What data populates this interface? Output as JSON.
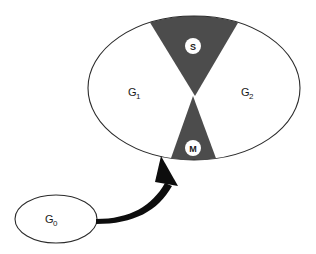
{
  "diagram": {
    "colors": {
      "background": "#ffffff",
      "outline": "#2b2b2b",
      "wedge_fill": "#4c4c4c",
      "phase_fill": "#ffffff",
      "badge_fill": "#ffffff",
      "badge_text": "#1a1a1a",
      "arrow": "#0d0d0d",
      "label_text": "#1a1a1a"
    },
    "main_cycle": {
      "name": "cell-cycle-ellipse",
      "phases": [
        {
          "id": "g1",
          "base": "G",
          "sub": "1",
          "kind": "gap",
          "shaded": false
        },
        {
          "id": "s",
          "base": "S",
          "sub": "",
          "kind": "synthesis",
          "shaded": true
        },
        {
          "id": "g2",
          "base": "G",
          "sub": "2",
          "kind": "gap",
          "shaded": false
        },
        {
          "id": "m",
          "base": "M",
          "sub": "",
          "kind": "mitosis",
          "shaded": true
        }
      ]
    },
    "quiescent": {
      "name": "g0-ellipse",
      "base": "G",
      "sub": "0"
    },
    "arrow": {
      "name": "g0-to-m-arrow",
      "from": "G0",
      "to": "M"
    }
  }
}
